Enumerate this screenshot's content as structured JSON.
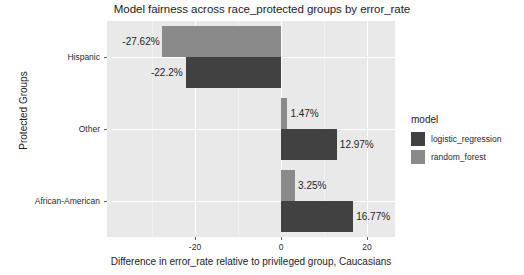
{
  "chart_data": {
    "type": "bar",
    "orientation": "horizontal",
    "title": "Model fairness across race_protected groups by error_rate",
    "xlabel": "Difference in error_rate relative to privileged group, Caucasians",
    "ylabel": "Protected Groups",
    "categories": [
      "Hispanic",
      "Other",
      "African-American"
    ],
    "xticks": [
      -20,
      0,
      20
    ],
    "xtick_labels": [
      "-20",
      "0",
      "20"
    ],
    "xlim": [
      -40.5,
      26.5
    ],
    "grid": true,
    "legend": {
      "title": "model",
      "position": "right",
      "entries": [
        {
          "label": "logistic_regression",
          "color": "#414141"
        },
        {
          "label": "random_forest",
          "color": "#8a8a8a"
        }
      ]
    },
    "series": [
      {
        "name": "logistic_regression",
        "color": "#414141",
        "values": [
          -22.2,
          12.97,
          16.77
        ],
        "data_labels": [
          "-22.2%",
          "12.97%",
          "16.77%"
        ]
      },
      {
        "name": "random_forest",
        "color": "#8a8a8a",
        "values": [
          -27.62,
          1.47,
          3.25
        ],
        "data_labels": [
          "-27.62%",
          "1.47%",
          "3.25%"
        ]
      }
    ],
    "points": [
      {
        "category": "Hispanic",
        "series": "random_forest",
        "value": -27.62,
        "label": "-27.62%"
      },
      {
        "category": "Hispanic",
        "series": "logistic_regression",
        "value": -22.2,
        "label": "-22.2%"
      },
      {
        "category": "Other",
        "series": "random_forest",
        "value": 1.47,
        "label": "1.47%"
      },
      {
        "category": "Other",
        "series": "logistic_regression",
        "value": 12.97,
        "label": "12.97%"
      },
      {
        "category": "African-American",
        "series": "random_forest",
        "value": 3.25,
        "label": "3.25%"
      },
      {
        "category": "African-American",
        "series": "logistic_regression",
        "value": 16.77,
        "label": "16.77%"
      }
    ],
    "colors": {
      "panel_background": "#e9e9e9",
      "gridline": "#ffffff",
      "text": "#1c1c1c"
    }
  }
}
